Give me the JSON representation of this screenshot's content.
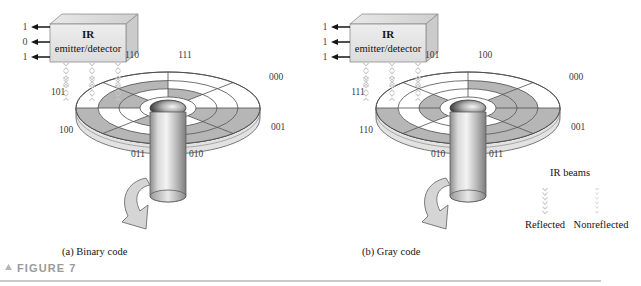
{
  "figure": {
    "number_label": "FIGURE 7",
    "marker_icon": "triangle-up-icon",
    "rule_color": "#b9b9b9"
  },
  "panels": [
    {
      "id": "binary",
      "caption": "(a) Binary code",
      "emitter": {
        "title": "IR",
        "subtitle": "emitter/detector",
        "output_bits": [
          "1",
          "0",
          "1"
        ],
        "arrow_icon": "arrow-left-icon",
        "beam_icon": "ir-beam-chevron-icon",
        "beam_count": 3
      },
      "disc": {
        "sector_labels": [
          "110",
          "111",
          "000",
          "001",
          "010",
          "011",
          "100",
          "101"
        ],
        "ring_count": 3,
        "sector_count": 8,
        "hub_icon": "disc-hub-icon",
        "shaft_icon": "rotating-shaft-icon",
        "rotation_icon": "rotation-arrow-icon"
      }
    },
    {
      "id": "gray",
      "caption": "(b) Gray code",
      "emitter": {
        "title": "IR",
        "subtitle": "emitter/detector",
        "output_bits": [
          "1",
          "1",
          "1"
        ],
        "arrow_icon": "arrow-left-icon",
        "beam_icon": "ir-beam-chevron-icon",
        "beam_count": 3
      },
      "disc": {
        "sector_labels": [
          "101",
          "100",
          "000",
          "001",
          "011",
          "010",
          "110",
          "111"
        ],
        "ring_count": 3,
        "sector_count": 8,
        "hub_icon": "disc-hub-icon",
        "shaft_icon": "rotating-shaft-icon",
        "rotation_icon": "rotation-arrow-icon"
      }
    }
  ],
  "legend": {
    "title": "IR beams",
    "reflected_label": "Reflected",
    "nonreflected_label": "Nonreflected",
    "reflected_icon": "ir-beam-reflected-icon",
    "nonreflected_icon": "ir-beam-nonreflected-icon"
  },
  "colors": {
    "disc_gray": "#b6b6b6",
    "disc_white": "#ffffff",
    "disc_edge": "#5a5a5a",
    "disc_rim": "#d8d8d8",
    "box_fill": "#e4e4e4",
    "box_top": "#d0d0d0",
    "shaft_light": "#f0f0f0",
    "shaft_dark": "#7e7e7e",
    "arrow_fill": "#d2d2d2",
    "beam_gray": "#c9c9c9",
    "rule": "#b9b9b9",
    "figure_label": "#9a9a9a"
  }
}
